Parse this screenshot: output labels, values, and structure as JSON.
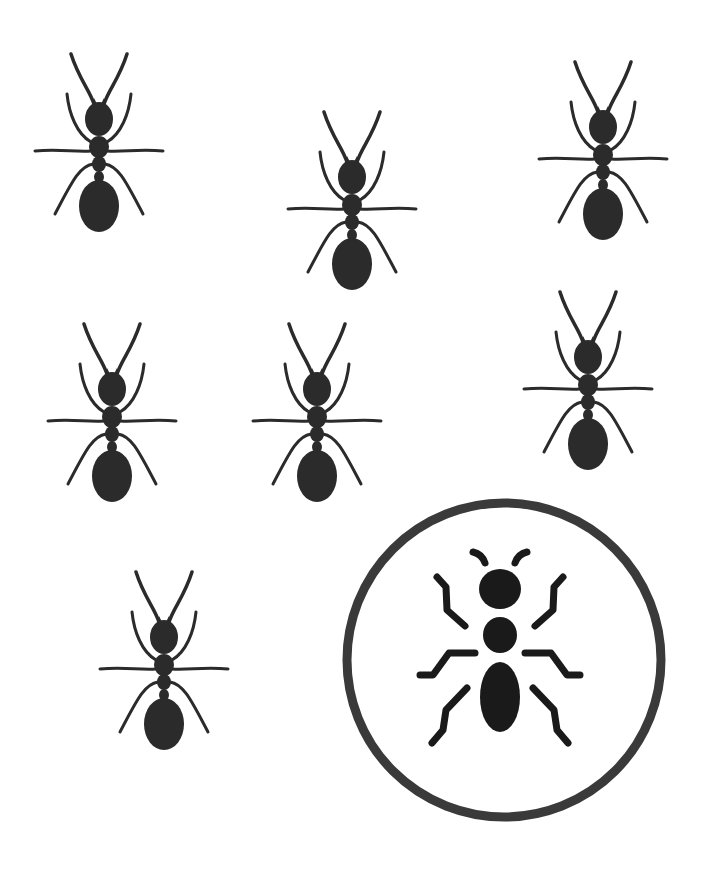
{
  "canvas": {
    "width": 705,
    "height": 871,
    "background": "#ffffff"
  },
  "colors": {
    "ant": "#2b2b2b",
    "badge_ring": "#3a3a3a",
    "badge_icon": "#1a1a1a"
  },
  "ants": [
    {
      "id": "ant-1",
      "cx": 99,
      "top": 52,
      "scale": 1.0
    },
    {
      "id": "ant-2",
      "cx": 352,
      "top": 110,
      "scale": 1.0
    },
    {
      "id": "ant-3",
      "cx": 603,
      "top": 60,
      "scale": 1.0
    },
    {
      "id": "ant-4",
      "cx": 112,
      "top": 322,
      "scale": 1.0
    },
    {
      "id": "ant-5",
      "cx": 317,
      "top": 322,
      "scale": 1.0
    },
    {
      "id": "ant-6",
      "cx": 588,
      "top": 290,
      "scale": 1.0
    },
    {
      "id": "ant-7",
      "cx": 164,
      "top": 570,
      "scale": 1.0
    }
  ],
  "badge": {
    "label": "ant-icon-badge",
    "cx": 504,
    "cy": 660,
    "r": 158
  }
}
